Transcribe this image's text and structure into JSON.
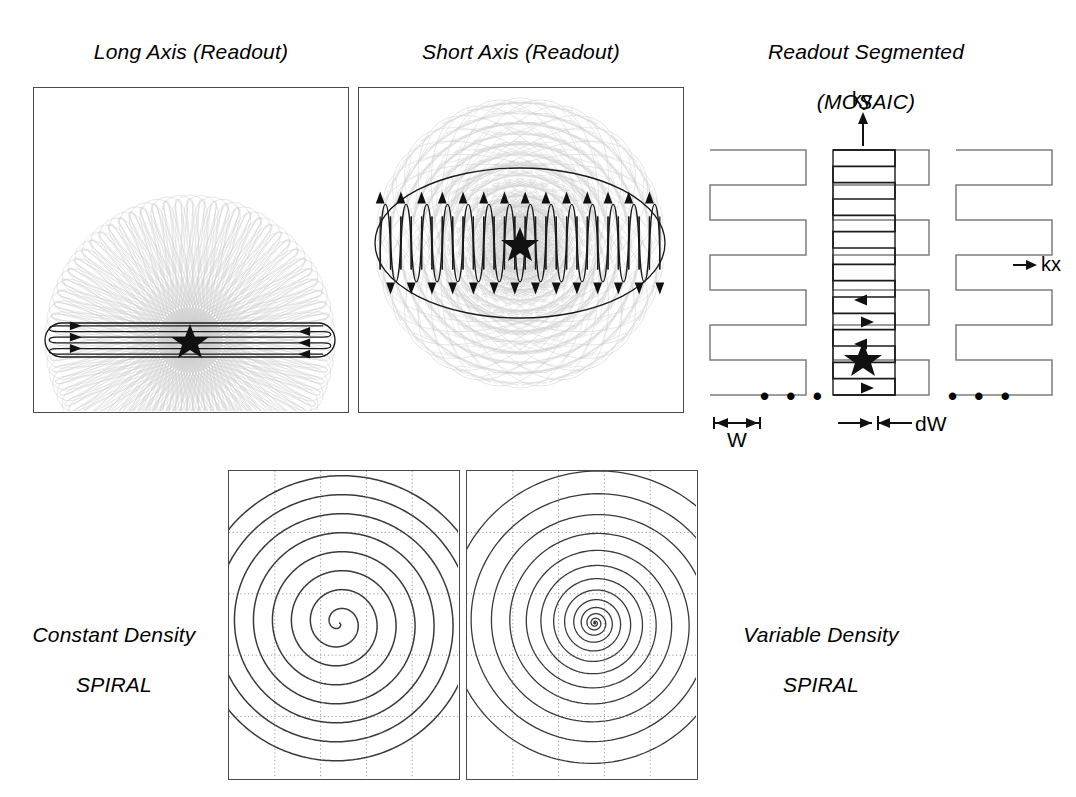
{
  "figure": {
    "background": "#ffffff",
    "stroke_dark": "#1a1a1a",
    "stroke_gray": "#7d7d7d",
    "stroke_light": "#cfcfcf",
    "grid_color": "#9a9a9a"
  },
  "panels": [
    {
      "id": "long-axis-propeller",
      "title_line1": "Long Axis (Readout)",
      "title_line2": "PROPELLER",
      "trajectory": "propeller-long-blade",
      "blades": 36,
      "lines_per_blade": 6,
      "highlighted_blade_angle_deg": 0,
      "center_marker": "star"
    },
    {
      "id": "short-axis-propeller",
      "title_line1": "Short Axis (Readout)",
      "title_line2": "PROPELLER",
      "trajectory": "propeller-short-blade",
      "blades": 16,
      "lines_per_blade": 28,
      "highlighted_blade_angle_deg": 90,
      "center_marker": "star"
    },
    {
      "id": "readout-segmented-mosaic",
      "title_line1": "Readout Segmented",
      "title_line2": "(MOSAIC)",
      "trajectory": "readout-segmented-epi",
      "segments": 3,
      "lines_per_segment": 8,
      "center_marker": "star",
      "axis_labels": {
        "ky": "ky",
        "kx": "kx"
      },
      "dimension_labels": {
        "width": "W",
        "shift": "dW"
      },
      "ellipsis": "• • •"
    },
    {
      "id": "constant-density-spiral",
      "title_line1": "Constant Density",
      "title_line2": "SPIRAL",
      "label_position": "left",
      "trajectory": "archimedean-spiral",
      "turns": 8,
      "density": "constant",
      "grid": {
        "rows": 4,
        "cols": 4,
        "style": "dotted"
      }
    },
    {
      "id": "variable-density-spiral",
      "title_line1": "Variable Density",
      "title_line2": "SPIRAL",
      "label_position": "right",
      "trajectory": "variable-density-spiral",
      "turns": 14,
      "density": "variable",
      "grid": {
        "rows": 4,
        "cols": 4,
        "style": "dotted"
      }
    }
  ],
  "chart_data": {
    "type": "line",
    "subplots": [
      {
        "name": "Long Axis (Readout) PROPELLER",
        "type": "rotating-blades",
        "blade_count": 36,
        "blade_length_rel": 1.0,
        "blade_width_rel": 0.11,
        "lines_per_blade": 6,
        "highlighted_angle_deg": 0
      },
      {
        "name": "Short Axis (Readout) PROPELLER",
        "type": "rotating-blades",
        "blade_count": 16,
        "blade_length_rel": 0.55,
        "blade_width_rel": 0.3,
        "lines_per_blade": 28,
        "highlighted_angle_deg": 90
      },
      {
        "name": "Readout Segmented (MOSAIC)",
        "type": "segmented-epi",
        "segment_count": 3,
        "lines_per_segment": 8,
        "segment_width_W": "W",
        "segment_shift_dW": "dW",
        "kx_axis": "kx",
        "ky_axis": "ky"
      },
      {
        "name": "Constant Density SPIRAL",
        "type": "spiral",
        "turns": 8,
        "radius_law": "r = a*theta",
        "grid_lines_x": 4,
        "grid_lines_y": 4
      },
      {
        "name": "Variable Density SPIRAL",
        "type": "spiral",
        "turns": 14,
        "radius_law": "r = a*theta^alpha (alpha>1)",
        "grid_lines_x": 4,
        "grid_lines_y": 4
      }
    ]
  }
}
